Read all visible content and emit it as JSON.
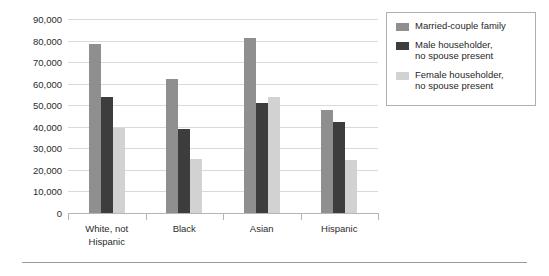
{
  "chart_data": {
    "type": "bar",
    "title": "",
    "subtitle": "",
    "xlabel": "",
    "ylabel": "",
    "categories": [
      "White, not\nHispanic",
      "Black",
      "Asian",
      "Hispanic"
    ],
    "series": [
      {
        "name": "Married-couple family",
        "color": "#8f8f8f",
        "values": [
          78500,
          62000,
          81000,
          48000
        ]
      },
      {
        "name": "Male householder,\nno spouse present",
        "color": "#3d3d3d",
        "values": [
          54000,
          39000,
          51000,
          42000
        ]
      },
      {
        "name": "Female householder,\nno spouse present",
        "color": "#d2d2d2",
        "values": [
          39500,
          25000,
          54000,
          24500
        ]
      }
    ],
    "ylim": [
      0,
      90000
    ],
    "ytick_values": [
      0,
      10000,
      20000,
      30000,
      40000,
      50000,
      60000,
      70000,
      80000,
      90000
    ],
    "ytick_labels": [
      "0",
      "10,000",
      "20,000",
      "30,000",
      "40,000",
      "50,000",
      "60,000",
      "70,000",
      "80,000",
      "90,000"
    ],
    "grid": true,
    "legend_position": "right"
  },
  "legend": {
    "items": [
      {
        "label": "Married-couple family"
      },
      {
        "label": "Male householder,\nno spouse present"
      },
      {
        "label": "Female householder,\nno spouse present"
      }
    ]
  }
}
